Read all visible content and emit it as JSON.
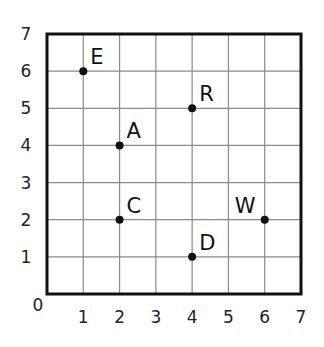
{
  "chart_data": {
    "type": "scatter",
    "title": "",
    "xlabel": "",
    "ylabel": "",
    "xlim": [
      0,
      7
    ],
    "ylim": [
      0,
      7
    ],
    "grid": true,
    "x_ticks": [
      "0",
      "1",
      "2",
      "3",
      "4",
      "5",
      "6",
      "7"
    ],
    "y_ticks": [
      "1",
      "2",
      "3",
      "4",
      "5",
      "6",
      "7"
    ],
    "origin_label": "0",
    "points": [
      {
        "label": "E",
        "x": 1,
        "y": 6
      },
      {
        "label": "R",
        "x": 4,
        "y": 5
      },
      {
        "label": "A",
        "x": 2,
        "y": 4
      },
      {
        "label": "C",
        "x": 2,
        "y": 2
      },
      {
        "label": "W",
        "x": 6,
        "y": 2
      },
      {
        "label": "D",
        "x": 4,
        "y": 1
      }
    ],
    "colors": {
      "grid": "#8a8a8a",
      "axis": "#111111",
      "point": "#111111",
      "text": "#222222"
    }
  }
}
